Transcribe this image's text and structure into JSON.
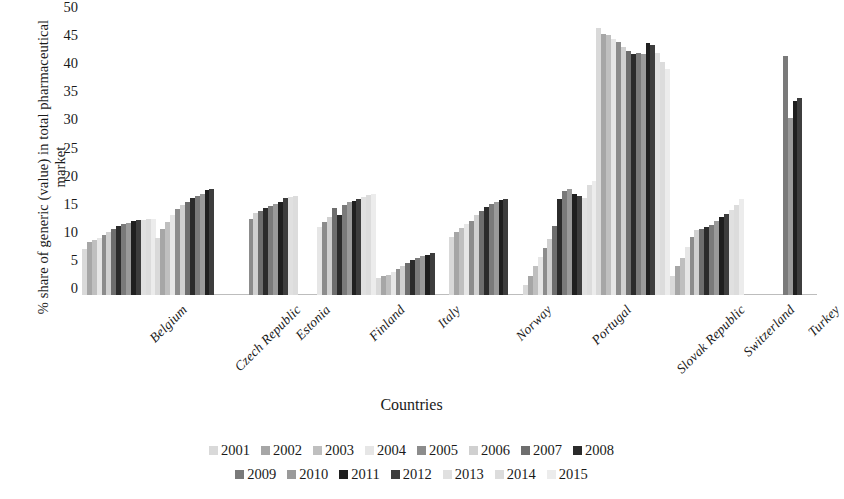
{
  "chart_data": {
    "type": "bar",
    "title": "",
    "xlabel": "Countries",
    "ylabel": "% share of generic (value) in total pharmaceutical market",
    "ylim": [
      0,
      50
    ],
    "yticks": [
      0,
      5,
      10,
      15,
      20,
      25,
      30,
      35,
      40,
      45,
      50
    ],
    "grid": false,
    "legend_position": "bottom",
    "categories": [
      "Belgium",
      "Czech Republic",
      "Estonia",
      "Finland",
      "Italy",
      "Norway",
      "Portugal",
      "Slovak Republic",
      "Switzerland",
      "Turkey"
    ],
    "series": [
      {
        "name": "2001",
        "color": "#d9d9d9",
        "values": [
          8.2,
          10.2,
          null,
          null,
          3.0,
          10.3,
          1.8,
          47.5,
          3.4,
          null
        ]
      },
      {
        "name": "2002",
        "color": "#a6a6a6",
        "values": [
          9.4,
          11.8,
          null,
          null,
          3.3,
          11.2,
          3.4,
          46.5,
          5.1,
          null
        ]
      },
      {
        "name": "2003",
        "color": "#bfbfbf",
        "values": [
          9.8,
          13.0,
          null,
          null,
          3.6,
          12.0,
          5.1,
          46.3,
          6.6,
          null
        ]
      },
      {
        "name": "2004",
        "color": "#e6e6e6",
        "values": [
          10.2,
          14.2,
          null,
          12.1,
          4.1,
          12.6,
          6.8,
          45.5,
          8.6,
          null
        ]
      },
      {
        "name": "2005",
        "color": "#8c8c8c",
        "values": [
          10.6,
          15.3,
          13.6,
          13.0,
          4.6,
          13.2,
          8.4,
          45.0,
          10.3,
          null
        ]
      },
      {
        "name": "2006",
        "color": "#d0d0d0",
        "values": [
          11.2,
          16.0,
          14.6,
          13.8,
          5.2,
          14.2,
          10.0,
          44.2,
          11.5,
          null
        ]
      },
      {
        "name": "2007",
        "color": "#6e6e6e",
        "values": [
          11.8,
          16.5,
          15.0,
          15.5,
          5.7,
          15.0,
          12.2,
          43.4,
          11.8,
          null
        ]
      },
      {
        "name": "2008",
        "color": "#2b2b2b",
        "values": [
          12.3,
          17.2,
          15.4,
          14.3,
          6.3,
          15.7,
          17.1,
          42.9,
          12.1,
          null
        ]
      },
      {
        "name": "2009",
        "color": "#7a7a7a",
        "values": [
          12.6,
          17.6,
          15.8,
          16.0,
          6.6,
          16.2,
          18.5,
          43.1,
          12.5,
          42.5
        ]
      },
      {
        "name": "2010",
        "color": "#9a9a9a",
        "values": [
          12.9,
          18.0,
          16.2,
          16.5,
          6.9,
          16.6,
          18.8,
          42.8,
          13.2,
          31.5
        ]
      },
      {
        "name": "2011",
        "color": "#1f1f1f",
        "values": [
          13.1,
          18.6,
          16.6,
          16.8,
          7.2,
          16.9,
          18.0,
          44.8,
          13.8,
          34.5
        ]
      },
      {
        "name": "2012",
        "color": "#3d3d3d",
        "values": [
          13.3,
          18.9,
          17.2,
          17.0,
          7.5,
          17.1,
          17.6,
          44.5,
          14.4,
          35.0
        ]
      },
      {
        "name": "2013",
        "color": "#e0e0e0",
        "values": [
          13.4,
          null,
          17.4,
          17.4,
          null,
          null,
          17.3,
          43.0,
          15.2,
          null
        ]
      },
      {
        "name": "2014",
        "color": "#dcdcdc",
        "values": [
          13.5,
          null,
          17.6,
          17.8,
          null,
          null,
          19.5,
          41.5,
          16.0,
          null
        ]
      },
      {
        "name": "2015",
        "color": "#ececec",
        "values": [
          13.6,
          null,
          null,
          18.0,
          null,
          null,
          20.3,
          40.2,
          17.0,
          null
        ]
      }
    ]
  },
  "legend": {
    "rows": [
      [
        "2001",
        "2002",
        "2003",
        "2004",
        "2005",
        "2006",
        "2007",
        "2008"
      ],
      [
        "2009",
        "2010",
        "2011",
        "2012",
        "2013",
        "2014",
        "2015"
      ]
    ]
  }
}
